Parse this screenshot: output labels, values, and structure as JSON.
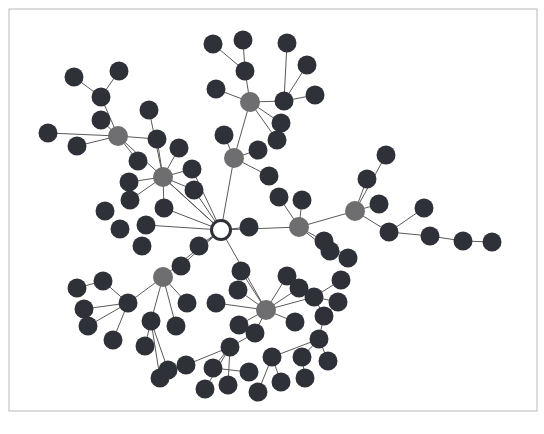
{
  "figure": {
    "title": "",
    "type": "network-graph",
    "width": 544,
    "height": 434,
    "background_color": "#ffffff"
  },
  "frame": {
    "name": "image-border",
    "stroke_color": "#b9b9b9",
    "stroke_width": 1,
    "x": 9,
    "y": 9,
    "width": 528,
    "height": 402
  },
  "style": {
    "edge_color": "#5a5a5a",
    "edge_width": 1.0,
    "node_radius_leaf": 9.5,
    "node_radius_hub": 10.0,
    "node_radius_root": 9.5,
    "color_leaf": "#2e3138",
    "color_hub": "#6e6e70",
    "color_root_fill": "#ffffff",
    "color_root_stroke": "#2e3138",
    "root_stroke_width": 3
  },
  "chart_data": {
    "type": "graph",
    "node_classes": [
      {
        "key": "root",
        "label": "root hub",
        "color": "#ffffff",
        "count": 1
      },
      {
        "key": "hub",
        "label": "branch hub",
        "color": "#6e6e70",
        "count": 7
      },
      {
        "key": "leaf",
        "label": "leaf node",
        "color": "#2e3138",
        "count": 111
      }
    ],
    "nodes": [
      {
        "id": 0,
        "x": 221,
        "y": 230,
        "class": "root"
      },
      {
        "id": 1,
        "x": 118,
        "y": 136,
        "class": "hub"
      },
      {
        "id": 2,
        "x": 163,
        "y": 177,
        "class": "hub"
      },
      {
        "id": 3,
        "x": 234,
        "y": 158,
        "class": "hub"
      },
      {
        "id": 4,
        "x": 250,
        "y": 102,
        "class": "hub"
      },
      {
        "id": 5,
        "x": 299,
        "y": 227,
        "class": "hub"
      },
      {
        "id": 6,
        "x": 355,
        "y": 211,
        "class": "hub"
      },
      {
        "id": 7,
        "x": 163,
        "y": 277,
        "class": "hub"
      },
      {
        "id": 8,
        "x": 266,
        "y": 310,
        "class": "hub"
      },
      {
        "id": 10,
        "x": 48,
        "y": 133,
        "class": "leaf"
      },
      {
        "id": 11,
        "x": 77,
        "y": 146,
        "class": "leaf"
      },
      {
        "id": 12,
        "x": 101,
        "y": 97,
        "class": "leaf"
      },
      {
        "id": 13,
        "x": 74,
        "y": 77,
        "class": "leaf"
      },
      {
        "id": 14,
        "x": 119,
        "y": 71,
        "class": "leaf"
      },
      {
        "id": 15,
        "x": 101,
        "y": 120,
        "class": "leaf"
      },
      {
        "id": 16,
        "x": 138,
        "y": 161,
        "class": "leaf"
      },
      {
        "id": 20,
        "x": 149,
        "y": 110,
        "class": "leaf"
      },
      {
        "id": 21,
        "x": 129,
        "y": 182,
        "class": "leaf"
      },
      {
        "id": 22,
        "x": 130,
        "y": 200,
        "class": "leaf"
      },
      {
        "id": 23,
        "x": 157,
        "y": 139,
        "class": "leaf"
      },
      {
        "id": 24,
        "x": 179,
        "y": 148,
        "class": "leaf"
      },
      {
        "id": 25,
        "x": 192,
        "y": 169,
        "class": "leaf"
      },
      {
        "id": 26,
        "x": 194,
        "y": 190,
        "class": "leaf"
      },
      {
        "id": 27,
        "x": 164,
        "y": 208,
        "class": "leaf"
      },
      {
        "id": 30,
        "x": 224,
        "y": 135,
        "class": "leaf"
      },
      {
        "id": 31,
        "x": 258,
        "y": 150,
        "class": "leaf"
      },
      {
        "id": 32,
        "x": 269,
        "y": 176,
        "class": "leaf"
      },
      {
        "id": 40,
        "x": 216,
        "y": 89,
        "class": "leaf"
      },
      {
        "id": 41,
        "x": 213,
        "y": 44,
        "class": "leaf"
      },
      {
        "id": 42,
        "x": 243,
        "y": 40,
        "class": "leaf"
      },
      {
        "id": 43,
        "x": 245,
        "y": 71,
        "class": "leaf"
      },
      {
        "id": 44,
        "x": 284,
        "y": 101,
        "class": "leaf"
      },
      {
        "id": 45,
        "x": 287,
        "y": 43,
        "class": "leaf"
      },
      {
        "id": 46,
        "x": 307,
        "y": 65,
        "class": "leaf"
      },
      {
        "id": 47,
        "x": 315,
        "y": 95,
        "class": "leaf"
      },
      {
        "id": 48,
        "x": 281,
        "y": 123,
        "class": "leaf"
      },
      {
        "id": 49,
        "x": 277,
        "y": 140,
        "class": "leaf"
      },
      {
        "id": 50,
        "x": 249,
        "y": 227,
        "class": "leaf"
      },
      {
        "id": 51,
        "x": 279,
        "y": 197,
        "class": "leaf"
      },
      {
        "id": 52,
        "x": 302,
        "y": 200,
        "class": "leaf"
      },
      {
        "id": 53,
        "x": 324,
        "y": 241,
        "class": "leaf"
      },
      {
        "id": 54,
        "x": 330,
        "y": 251,
        "class": "leaf"
      },
      {
        "id": 55,
        "x": 348,
        "y": 258,
        "class": "leaf"
      },
      {
        "id": 60,
        "x": 367,
        "y": 179,
        "class": "leaf"
      },
      {
        "id": 61,
        "x": 386,
        "y": 155,
        "class": "leaf"
      },
      {
        "id": 62,
        "x": 379,
        "y": 204,
        "class": "leaf"
      },
      {
        "id": 63,
        "x": 389,
        "y": 232,
        "class": "leaf"
      },
      {
        "id": 64,
        "x": 424,
        "y": 208,
        "class": "leaf"
      },
      {
        "id": 65,
        "x": 430,
        "y": 236,
        "class": "leaf"
      },
      {
        "id": 66,
        "x": 463,
        "y": 241,
        "class": "leaf"
      },
      {
        "id": 67,
        "x": 492,
        "y": 242,
        "class": "leaf"
      },
      {
        "id": 70,
        "x": 199,
        "y": 246,
        "class": "leaf"
      },
      {
        "id": 71,
        "x": 181,
        "y": 266,
        "class": "leaf"
      },
      {
        "id": 72,
        "x": 142,
        "y": 246,
        "class": "leaf"
      },
      {
        "id": 73,
        "x": 146,
        "y": 225,
        "class": "leaf"
      },
      {
        "id": 74,
        "x": 120,
        "y": 229,
        "class": "leaf"
      },
      {
        "id": 75,
        "x": 105,
        "y": 211,
        "class": "leaf"
      },
      {
        "id": 80,
        "x": 128,
        "y": 303,
        "class": "leaf"
      },
      {
        "id": 81,
        "x": 103,
        "y": 281,
        "class": "leaf"
      },
      {
        "id": 82,
        "x": 84,
        "y": 309,
        "class": "leaf"
      },
      {
        "id": 83,
        "x": 88,
        "y": 326,
        "class": "leaf"
      },
      {
        "id": 84,
        "x": 113,
        "y": 340,
        "class": "leaf"
      },
      {
        "id": 85,
        "x": 77,
        "y": 288,
        "class": "leaf"
      },
      {
        "id": 86,
        "x": 151,
        "y": 321,
        "class": "leaf"
      },
      {
        "id": 87,
        "x": 145,
        "y": 346,
        "class": "leaf"
      },
      {
        "id": 88,
        "x": 176,
        "y": 326,
        "class": "leaf"
      },
      {
        "id": 89,
        "x": 187,
        "y": 303,
        "class": "leaf"
      },
      {
        "id": 90,
        "x": 168,
        "y": 370,
        "class": "leaf"
      },
      {
        "id": 91,
        "x": 160,
        "y": 378,
        "class": "leaf"
      },
      {
        "id": 100,
        "x": 238,
        "y": 290,
        "class": "leaf"
      },
      {
        "id": 101,
        "x": 216,
        "y": 303,
        "class": "leaf"
      },
      {
        "id": 102,
        "x": 241,
        "y": 271,
        "class": "leaf"
      },
      {
        "id": 103,
        "x": 255,
        "y": 333,
        "class": "leaf"
      },
      {
        "id": 104,
        "x": 230,
        "y": 347,
        "class": "leaf"
      },
      {
        "id": 105,
        "x": 287,
        "y": 276,
        "class": "leaf"
      },
      {
        "id": 106,
        "x": 299,
        "y": 288,
        "class": "leaf"
      },
      {
        "id": 107,
        "x": 314,
        "y": 297,
        "class": "leaf"
      },
      {
        "id": 108,
        "x": 324,
        "y": 316,
        "class": "leaf"
      },
      {
        "id": 109,
        "x": 295,
        "y": 322,
        "class": "leaf"
      },
      {
        "id": 110,
        "x": 341,
        "y": 280,
        "class": "leaf"
      },
      {
        "id": 111,
        "x": 338,
        "y": 302,
        "class": "leaf"
      },
      {
        "id": 112,
        "x": 319,
        "y": 339,
        "class": "leaf"
      },
      {
        "id": 120,
        "x": 213,
        "y": 368,
        "class": "leaf"
      },
      {
        "id": 121,
        "x": 186,
        "y": 365,
        "class": "leaf"
      },
      {
        "id": 122,
        "x": 205,
        "y": 389,
        "class": "leaf"
      },
      {
        "id": 123,
        "x": 228,
        "y": 385,
        "class": "leaf"
      },
      {
        "id": 124,
        "x": 249,
        "y": 372,
        "class": "leaf"
      },
      {
        "id": 125,
        "x": 272,
        "y": 357,
        "class": "leaf"
      },
      {
        "id": 126,
        "x": 281,
        "y": 382,
        "class": "leaf"
      },
      {
        "id": 127,
        "x": 258,
        "y": 392,
        "class": "leaf"
      },
      {
        "id": 128,
        "x": 305,
        "y": 378,
        "class": "leaf"
      },
      {
        "id": 129,
        "x": 302,
        "y": 357,
        "class": "leaf"
      },
      {
        "id": 130,
        "x": 328,
        "y": 361,
        "class": "leaf"
      },
      {
        "id": 131,
        "x": 239,
        "y": 325,
        "class": "leaf"
      }
    ],
    "edges": [
      [
        0,
        1
      ],
      [
        0,
        2
      ],
      [
        0,
        3
      ],
      [
        0,
        5
      ],
      [
        0,
        7
      ],
      [
        0,
        8
      ],
      [
        0,
        50
      ],
      [
        0,
        70
      ],
      [
        0,
        71
      ],
      [
        0,
        73
      ],
      [
        0,
        27
      ],
      [
        0,
        26
      ],
      [
        0,
        25
      ],
      [
        1,
        10
      ],
      [
        1,
        11
      ],
      [
        1,
        12
      ],
      [
        1,
        15
      ],
      [
        1,
        16
      ],
      [
        1,
        23
      ],
      [
        12,
        13
      ],
      [
        12,
        14
      ],
      [
        2,
        20
      ],
      [
        2,
        21
      ],
      [
        2,
        22
      ],
      [
        2,
        23
      ],
      [
        2,
        24
      ],
      [
        2,
        25
      ],
      [
        2,
        26
      ],
      [
        2,
        27
      ],
      [
        3,
        30
      ],
      [
        3,
        31
      ],
      [
        3,
        32
      ],
      [
        3,
        4
      ],
      [
        4,
        40
      ],
      [
        4,
        43
      ],
      [
        4,
        44
      ],
      [
        4,
        48
      ],
      [
        4,
        49
      ],
      [
        43,
        41
      ],
      [
        43,
        42
      ],
      [
        44,
        45
      ],
      [
        44,
        46
      ],
      [
        44,
        47
      ],
      [
        5,
        51
      ],
      [
        5,
        52
      ],
      [
        5,
        53
      ],
      [
        5,
        54
      ],
      [
        5,
        6
      ],
      [
        53,
        55
      ],
      [
        6,
        60
      ],
      [
        6,
        61
      ],
      [
        6,
        62
      ],
      [
        6,
        63
      ],
      [
        63,
        64
      ],
      [
        63,
        65
      ],
      [
        65,
        66
      ],
      [
        66,
        67
      ],
      [
        7,
        80
      ],
      [
        7,
        86
      ],
      [
        7,
        88
      ],
      [
        7,
        89
      ],
      [
        80,
        81
      ],
      [
        80,
        82
      ],
      [
        80,
        83
      ],
      [
        80,
        84
      ],
      [
        81,
        85
      ],
      [
        86,
        87
      ],
      [
        86,
        90
      ],
      [
        86,
        91
      ],
      [
        8,
        100
      ],
      [
        8,
        101
      ],
      [
        8,
        102
      ],
      [
        8,
        103
      ],
      [
        8,
        105
      ],
      [
        8,
        106
      ],
      [
        8,
        107
      ],
      [
        8,
        109
      ],
      [
        8,
        131
      ],
      [
        103,
        104
      ],
      [
        107,
        108
      ],
      [
        107,
        110
      ],
      [
        107,
        111
      ],
      [
        108,
        112
      ],
      [
        104,
        120
      ],
      [
        104,
        121
      ],
      [
        104,
        122
      ],
      [
        104,
        123
      ],
      [
        120,
        124
      ],
      [
        112,
        125
      ],
      [
        112,
        129
      ],
      [
        112,
        130
      ],
      [
        125,
        126
      ],
      [
        125,
        127
      ],
      [
        129,
        128
      ]
    ]
  }
}
